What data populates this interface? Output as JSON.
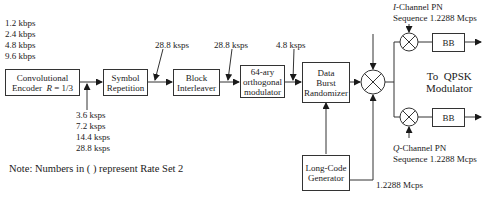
{
  "input_rates": [
    "1.2 kbps",
    "2.4 kbps",
    "4.8 kbps",
    "9.6 kbps"
  ],
  "blocks": {
    "conv_encoder": {
      "line1": "Convolutional",
      "line2_prefix": "Encoder",
      "rate_symbol": "R",
      "rate_value": " = 1/3"
    },
    "symbol_repetition": {
      "line1": "Symbol",
      "line2": "Repetition"
    },
    "block_interleaver": {
      "line1": "Block",
      "line2": "Interleaver"
    },
    "orthogonal_modulator": {
      "line1": "64-ary",
      "line2": "orthogonal",
      "line3": "modulator"
    },
    "data_burst_randomizer": {
      "line1": "Data",
      "line2": "Burst",
      "line3": "Randomizer"
    },
    "long_code_generator": {
      "line1": "Long-Code",
      "line2": "Generator"
    },
    "bb_i": {
      "label": "BB"
    },
    "bb_q": {
      "label": "BB"
    }
  },
  "encoder_output_rates": [
    "3.6 ksps",
    "7.2 ksps",
    "14.4 ksps",
    "28.8 ksps"
  ],
  "rate_labels": {
    "after_repetition": "28.8 ksps",
    "after_interleaver": "28.8 ksps",
    "after_modulator": "4.8 ksps",
    "long_code": "1.2288 Mcps"
  },
  "i_channel": {
    "letter": "I",
    "line1_suffix": "-Channel PN",
    "line2": "Sequence 1.2288 Mcps"
  },
  "q_channel": {
    "letter": "Q",
    "line1_suffix": "-Channel PN",
    "line2": "Sequence 1.2288 Mcps"
  },
  "output": {
    "line1": "To  QPSK",
    "line2": "Modulator"
  },
  "note": "Note: Numbers in ( ) represent Rate Set 2"
}
